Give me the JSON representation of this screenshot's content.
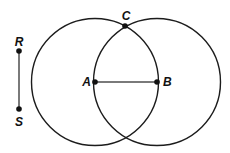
{
  "figure": {
    "background_color": "#ffffff",
    "circle_stroke_color": "#1c1c1c",
    "circle_stroke_width": 1.4,
    "segment_color": "#7a7a7a",
    "segment_stroke_width": 2,
    "point_color": "#111111",
    "point_radius": 2.8,
    "label_color": "#111111",
    "circles": [
      {
        "name": "circle-centered-at-A",
        "cx": 95,
        "cy": 82,
        "r": 63.5
      },
      {
        "name": "circle-centered-at-B",
        "cx": 157,
        "cy": 82,
        "r": 63.5
      }
    ],
    "segments": [
      {
        "name": "segment-RS",
        "x1": 19,
        "y1": 51,
        "x2": 19,
        "y2": 109
      },
      {
        "name": "segment-AB",
        "x1": 95,
        "y1": 82,
        "x2": 157,
        "y2": 82
      }
    ],
    "points": [
      {
        "name": "point-R",
        "x": 19,
        "y": 51,
        "label": "R",
        "lx": 19,
        "ly": 46,
        "anchor": "middle"
      },
      {
        "name": "point-S",
        "x": 19,
        "y": 109,
        "label": "S",
        "lx": 19,
        "ly": 126,
        "anchor": "middle"
      },
      {
        "name": "point-A",
        "x": 95,
        "y": 82,
        "label": "A",
        "lx": 91,
        "ly": 86,
        "anchor": "end"
      },
      {
        "name": "point-B",
        "x": 157,
        "y": 82,
        "label": "B",
        "lx": 163,
        "ly": 86,
        "anchor": "start"
      },
      {
        "name": "point-C",
        "x": 125,
        "y": 26,
        "label": "C",
        "lx": 126,
        "ly": 20,
        "anchor": "middle"
      }
    ]
  }
}
